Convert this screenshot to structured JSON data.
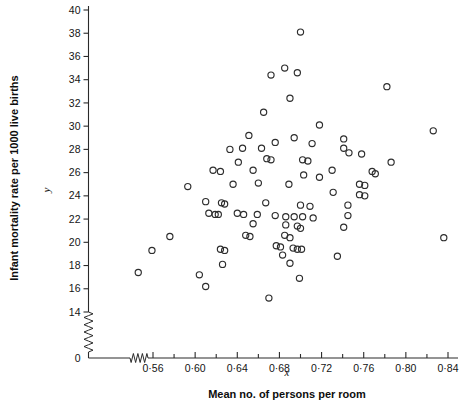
{
  "figure": {
    "background": "#ffffff",
    "marker_color": "#2d2d2d",
    "axis_color": "#2a2a2a"
  },
  "axes": {
    "y_title": "Infant mortality rate per 1000 live births",
    "y_var": "y",
    "x_title": "Mean no. of persons per room",
    "x_var": "x",
    "y_ticks": [
      "14",
      "16",
      "18",
      "20",
      "22",
      "24",
      "26",
      "28",
      "30",
      "32",
      "34",
      "36",
      "38",
      "40"
    ],
    "y_zero_tick": "0",
    "x_ticks": [
      "0·56",
      "0·60",
      "0·64",
      "0·68",
      "0·72",
      "0·76",
      "0·80",
      "0·84"
    ],
    "axis_break_note": "zigzag break on both axes near origin"
  },
  "chart_data": {
    "type": "scatter",
    "title": "",
    "xlabel": "Mean no. of persons per room",
    "ylabel": "Infant mortality rate per 1000 live births",
    "xvar": "x",
    "yvar": "y",
    "xlim": [
      0.545,
      0.845
    ],
    "ylim": [
      14,
      40
    ],
    "ytick_values": [
      14,
      16,
      18,
      20,
      22,
      24,
      26,
      28,
      30,
      32,
      34,
      36,
      38,
      40
    ],
    "xtick_values": [
      0.56,
      0.6,
      0.64,
      0.68,
      0.72,
      0.76,
      0.8,
      0.84
    ],
    "xtick_labels": [
      "0·56",
      "0·60",
      "0·64",
      "0·68",
      "0·72",
      "0·76",
      "0·80",
      "0·84"
    ],
    "minor_xtick_step": 0.02,
    "grid": false,
    "legend": null,
    "axis_break": {
      "y_below": 14,
      "x_below": 0.545
    },
    "marker": "open-circle",
    "n_points": 90,
    "points": [
      [
        0.7,
        38.1
      ],
      [
        0.685,
        35.0
      ],
      [
        0.697,
        34.6
      ],
      [
        0.672,
        34.4
      ],
      [
        0.782,
        33.4
      ],
      [
        0.69,
        32.4
      ],
      [
        0.665,
        31.2
      ],
      [
        0.718,
        30.1
      ],
      [
        0.826,
        29.6
      ],
      [
        0.651,
        29.2
      ],
      [
        0.694,
        29.0
      ],
      [
        0.741,
        28.9
      ],
      [
        0.711,
        28.5
      ],
      [
        0.676,
        28.6
      ],
      [
        0.645,
        28.1
      ],
      [
        0.633,
        28.0
      ],
      [
        0.663,
        28.1
      ],
      [
        0.741,
        28.1
      ],
      [
        0.746,
        27.7
      ],
      [
        0.758,
        27.6
      ],
      [
        0.641,
        26.9
      ],
      [
        0.668,
        27.2
      ],
      [
        0.672,
        27.1
      ],
      [
        0.702,
        27.1
      ],
      [
        0.707,
        27.0
      ],
      [
        0.786,
        26.9
      ],
      [
        0.617,
        26.2
      ],
      [
        0.624,
        26.1
      ],
      [
        0.655,
        26.2
      ],
      [
        0.73,
        26.2
      ],
      [
        0.768,
        26.1
      ],
      [
        0.771,
        25.9
      ],
      [
        0.703,
        25.8
      ],
      [
        0.718,
        25.6
      ],
      [
        0.593,
        24.8
      ],
      [
        0.636,
        25.0
      ],
      [
        0.66,
        25.1
      ],
      [
        0.689,
        25.0
      ],
      [
        0.756,
        25.0
      ],
      [
        0.761,
        24.9
      ],
      [
        0.731,
        24.3
      ],
      [
        0.756,
        24.1
      ],
      [
        0.761,
        24.0
      ],
      [
        0.61,
        23.5
      ],
      [
        0.625,
        23.4
      ],
      [
        0.628,
        23.3
      ],
      [
        0.667,
        23.4
      ],
      [
        0.7,
        23.2
      ],
      [
        0.709,
        23.1
      ],
      [
        0.745,
        23.2
      ],
      [
        0.613,
        22.5
      ],
      [
        0.619,
        22.4
      ],
      [
        0.622,
        22.4
      ],
      [
        0.64,
        22.5
      ],
      [
        0.646,
        22.4
      ],
      [
        0.659,
        22.4
      ],
      [
        0.676,
        22.3
      ],
      [
        0.686,
        22.2
      ],
      [
        0.694,
        22.2
      ],
      [
        0.702,
        22.2
      ],
      [
        0.712,
        22.1
      ],
      [
        0.745,
        22.3
      ],
      [
        0.655,
        21.6
      ],
      [
        0.686,
        21.5
      ],
      [
        0.697,
        21.4
      ],
      [
        0.7,
        21.2
      ],
      [
        0.741,
        21.3
      ],
      [
        0.576,
        20.5
      ],
      [
        0.648,
        20.6
      ],
      [
        0.652,
        20.5
      ],
      [
        0.685,
        20.6
      ],
      [
        0.69,
        20.4
      ],
      [
        0.836,
        20.4
      ],
      [
        0.677,
        19.7
      ],
      [
        0.681,
        19.6
      ],
      [
        0.693,
        19.5
      ],
      [
        0.697,
        19.4
      ],
      [
        0.701,
        19.4
      ],
      [
        0.624,
        19.4
      ],
      [
        0.628,
        19.3
      ],
      [
        0.559,
        19.3
      ],
      [
        0.683,
        18.9
      ],
      [
        0.735,
        18.8
      ],
      [
        0.69,
        18.2
      ],
      [
        0.626,
        18.1
      ],
      [
        0.546,
        17.4
      ],
      [
        0.604,
        17.2
      ],
      [
        0.699,
        16.9
      ],
      [
        0.61,
        16.2
      ],
      [
        0.67,
        15.2
      ]
    ]
  }
}
